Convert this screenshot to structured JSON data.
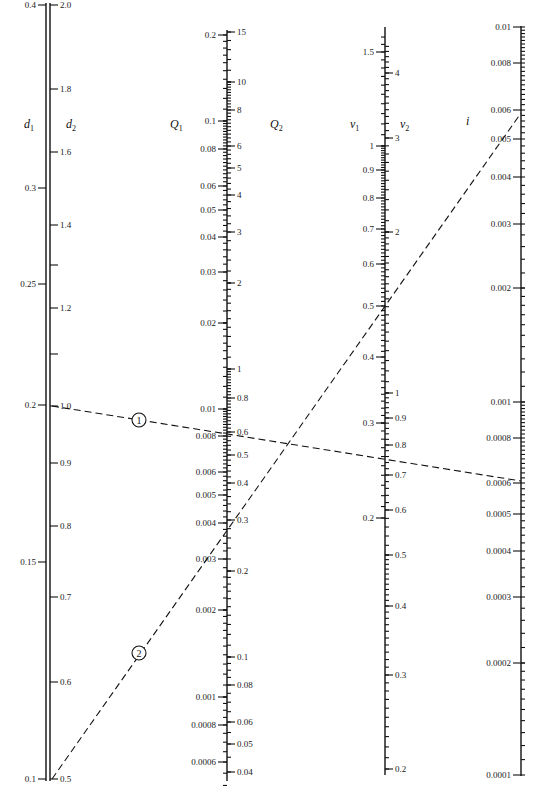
{
  "chart_data": {
    "type": "nomogram",
    "title": "",
    "axes": [
      {
        "id": "d1",
        "name": "d1",
        "side": "left",
        "scale": "log",
        "x": 46,
        "range": [
          0.1,
          0.4
        ],
        "ticks": [
          {
            "v": 0.4,
            "y": 5,
            "label": "0.4"
          },
          {
            "v": 0.3,
            "y": 188,
            "label": "0.3"
          },
          {
            "v": 0.25,
            "y": 284,
            "label": "0.25"
          },
          {
            "v": 0.2,
            "y": 405,
            "label": "0.2"
          },
          {
            "v": 0.15,
            "y": 562,
            "label": "0.15"
          },
          {
            "v": 0.1,
            "y": 779,
            "label": "0.1"
          }
        ]
      },
      {
        "id": "d2",
        "name": "d2",
        "side": "right",
        "scale": "log",
        "x": 50,
        "range": [
          0.5,
          2.0
        ],
        "ticks": [
          {
            "v": 2.0,
            "y": 5,
            "label": "2.0"
          },
          {
            "v": 1.8,
            "y": 89,
            "label": "1.8"
          },
          {
            "v": 1.6,
            "y": 152,
            "label": "1.6"
          },
          {
            "v": 1.4,
            "y": 225,
            "label": "1.4"
          },
          {
            "v": 1.3,
            "y": 265,
            "label": ""
          },
          {
            "v": 1.2,
            "y": 308,
            "label": "1.2"
          },
          {
            "v": 1.1,
            "y": 354,
            "label": ""
          },
          {
            "v": 1.0,
            "y": 406,
            "label": "1.0"
          },
          {
            "v": 0.9,
            "y": 463,
            "label": "0.9"
          },
          {
            "v": 0.8,
            "y": 526,
            "label": "0.8"
          },
          {
            "v": 0.7,
            "y": 597,
            "label": "0.7"
          },
          {
            "v": 0.6,
            "y": 682,
            "label": "0.6"
          },
          {
            "v": 0.5,
            "y": 779,
            "label": "0.5"
          }
        ]
      },
      {
        "id": "Q1",
        "name": "Q1",
        "side": "left",
        "scale": "log",
        "x": 227,
        "range": [
          0.0005,
          0.2
        ],
        "ticks": [
          {
            "v": 0.2,
            "y": 35,
            "label": "0.2"
          },
          {
            "v": 0.1,
            "y": 121,
            "label": "0.1"
          },
          {
            "v": 0.08,
            "y": 149,
            "label": "0.08"
          },
          {
            "v": 0.06,
            "y": 186,
            "label": "0.06"
          },
          {
            "v": 0.05,
            "y": 210,
            "label": "0.05"
          },
          {
            "v": 0.04,
            "y": 237,
            "label": "0.04"
          },
          {
            "v": 0.03,
            "y": 272,
            "label": "0.03"
          },
          {
            "v": 0.02,
            "y": 323,
            "label": "0.02"
          },
          {
            "v": 0.01,
            "y": 409,
            "label": "0.01"
          },
          {
            "v": 0.008,
            "y": 436,
            "label": "0.008"
          },
          {
            "v": 0.006,
            "y": 472,
            "label": "0.006"
          },
          {
            "v": 0.005,
            "y": 495,
            "label": "0.005"
          },
          {
            "v": 0.004,
            "y": 523,
            "label": "0.004"
          },
          {
            "v": 0.003,
            "y": 559,
            "label": "0.003"
          },
          {
            "v": 0.002,
            "y": 610,
            "label": "0.002"
          },
          {
            "v": 0.001,
            "y": 697,
            "label": "0.001"
          },
          {
            "v": 0.0008,
            "y": 725,
            "label": "0.0008"
          },
          {
            "v": 0.0006,
            "y": 762,
            "label": "0.0006"
          }
        ]
      },
      {
        "id": "Q2",
        "name": "Q2",
        "side": "right",
        "scale": "log",
        "x": 227,
        "range": [
          0.04,
          15
        ],
        "ticks": [
          {
            "v": 15,
            "y": 32,
            "label": "15"
          },
          {
            "v": 10,
            "y": 82,
            "label": "10"
          },
          {
            "v": 8,
            "y": 110,
            "label": "8"
          },
          {
            "v": 6,
            "y": 146,
            "label": "6"
          },
          {
            "v": 5,
            "y": 168,
            "label": "5"
          },
          {
            "v": 4,
            "y": 195,
            "label": "4"
          },
          {
            "v": 3,
            "y": 232,
            "label": "3"
          },
          {
            "v": 2,
            "y": 283,
            "label": "2"
          },
          {
            "v": 1,
            "y": 369,
            "label": "1"
          },
          {
            "v": 0.8,
            "y": 398,
            "label": "0.8"
          },
          {
            "v": 0.6,
            "y": 432,
            "label": "0.6"
          },
          {
            "v": 0.5,
            "y": 455,
            "label": "0.5"
          },
          {
            "v": 0.4,
            "y": 483,
            "label": "0.4"
          },
          {
            "v": 0.3,
            "y": 520,
            "label": "0.3"
          },
          {
            "v": 0.2,
            "y": 571,
            "label": "0.2"
          },
          {
            "v": 0.1,
            "y": 657,
            "label": "0.1"
          },
          {
            "v": 0.08,
            "y": 685,
            "label": "0.08"
          },
          {
            "v": 0.06,
            "y": 722,
            "label": "0.06"
          },
          {
            "v": 0.05,
            "y": 744,
            "label": "0.05"
          },
          {
            "v": 0.04,
            "y": 772,
            "label": "0.04"
          }
        ]
      },
      {
        "id": "v1",
        "name": "v1",
        "side": "left",
        "scale": "log",
        "x": 385,
        "range": [
          0.2,
          1.6
        ],
        "ticks": [
          {
            "v": 1.5,
            "y": 52,
            "label": "1.5"
          },
          {
            "v": 1.0,
            "y": 146,
            "label": "1"
          },
          {
            "v": 0.9,
            "y": 170,
            "label": "0.9"
          },
          {
            "v": 0.8,
            "y": 198,
            "label": "0.8"
          },
          {
            "v": 0.7,
            "y": 229,
            "label": "0.7"
          },
          {
            "v": 0.6,
            "y": 264,
            "label": "0.6"
          },
          {
            "v": 0.5,
            "y": 306,
            "label": "0.5"
          },
          {
            "v": 0.4,
            "y": 357,
            "label": "0.4"
          },
          {
            "v": 0.3,
            "y": 423,
            "label": "0.3"
          },
          {
            "v": 0.2,
            "y": 518,
            "label": "0.2"
          }
        ]
      },
      {
        "id": "v2",
        "name": "v2",
        "side": "right",
        "scale": "log",
        "x": 385,
        "range": [
          0.2,
          4.5
        ],
        "ticks": [
          {
            "v": 4,
            "y": 73,
            "label": "4"
          },
          {
            "v": 3,
            "y": 138,
            "label": "3"
          },
          {
            "v": 2,
            "y": 232,
            "label": "2"
          },
          {
            "v": 1,
            "y": 393,
            "label": "1"
          },
          {
            "v": 0.9,
            "y": 418,
            "label": "0.9"
          },
          {
            "v": 0.8,
            "y": 445,
            "label": "0.8"
          },
          {
            "v": 0.7,
            "y": 475,
            "label": "0.7"
          },
          {
            "v": 0.6,
            "y": 510,
            "label": "0.6"
          },
          {
            "v": 0.5,
            "y": 555,
            "label": "0.5"
          },
          {
            "v": 0.4,
            "y": 606,
            "label": "0.4"
          },
          {
            "v": 0.3,
            "y": 675,
            "label": "0.3"
          },
          {
            "v": 0.2,
            "y": 769,
            "label": "0.2"
          }
        ]
      },
      {
        "id": "i",
        "name": "i",
        "side": "left",
        "scale": "log",
        "x": 521,
        "range": [
          0.0001,
          0.01
        ],
        "ticks": [
          {
            "v": 0.01,
            "y": 27,
            "label": "0.01"
          },
          {
            "v": 0.008,
            "y": 63,
            "label": "0.008"
          },
          {
            "v": 0.006,
            "y": 110,
            "label": "0.006"
          },
          {
            "v": 0.005,
            "y": 139,
            "label": "0.005"
          },
          {
            "v": 0.004,
            "y": 177,
            "label": "0.004"
          },
          {
            "v": 0.003,
            "y": 224,
            "label": "0.003"
          },
          {
            "v": 0.002,
            "y": 288,
            "label": "0.002"
          },
          {
            "v": 0.001,
            "y": 402,
            "label": "0.001"
          },
          {
            "v": 0.0008,
            "y": 438,
            "label": "0.0008"
          },
          {
            "v": 0.0006,
            "y": 483,
            "label": "0.0006"
          },
          {
            "v": 0.0005,
            "y": 514,
            "label": "0.0005"
          },
          {
            "v": 0.0004,
            "y": 551,
            "label": "0.0004"
          },
          {
            "v": 0.0003,
            "y": 597,
            "label": "0.0003"
          },
          {
            "v": 0.0002,
            "y": 663,
            "label": "0.0002"
          },
          {
            "v": 0.0001,
            "y": 775,
            "label": "0.0001"
          }
        ]
      }
    ],
    "axis_labels": [
      {
        "text": "d",
        "sub": "1",
        "x": 24,
        "y": 128
      },
      {
        "text": "d",
        "sub": "2",
        "x": 66,
        "y": 128
      },
      {
        "text": "Q",
        "sub": "1",
        "x": 170,
        "y": 128
      },
      {
        "text": "Q",
        "sub": "2",
        "x": 270,
        "y": 128
      },
      {
        "text": "v",
        "sub": "1",
        "x": 350,
        "y": 128
      },
      {
        "text": "v",
        "sub": "2",
        "x": 400,
        "y": 128
      },
      {
        "text": "i",
        "sub": "",
        "x": 466,
        "y": 125
      }
    ],
    "isopleths": [
      {
        "id": "1",
        "label": "1",
        "from": {
          "axis": "d2",
          "value": 1.0
        },
        "through": {
          "axis": "Q",
          "Q1": 0.008,
          "Q2": 0.6
        },
        "to": {
          "axis": "i",
          "value": 0.0006
        },
        "crosses": {
          "v2": 0.75
        },
        "points": [
          [
            52,
            406
          ],
          [
            227,
            436
          ],
          [
            521,
            481
          ]
        ],
        "marker": [
          139,
          420
        ]
      },
      {
        "id": "2",
        "label": "2",
        "from": {
          "axis": "d2",
          "value": 0.5
        },
        "through": {
          "axis": "Q",
          "Q1": 0.004,
          "Q2": 0.3
        },
        "crosses": {
          "v1": 0.5
        },
        "to": {
          "axis": "i",
          "value": 0.0058
        },
        "points": [
          [
            52,
            779
          ],
          [
            227,
            522
          ],
          [
            385,
            304
          ],
          [
            521,
            113
          ]
        ],
        "marker": [
          139,
          653
        ]
      }
    ]
  }
}
